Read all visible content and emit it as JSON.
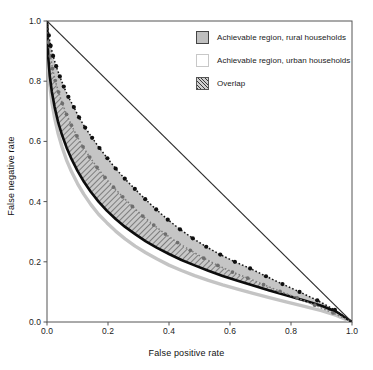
{
  "chart_data": {
    "type": "line",
    "title": "",
    "xlabel": "False positive rate",
    "ylabel": "False negative rate",
    "xlim": [
      0.0,
      1.0
    ],
    "ylim": [
      0.0,
      1.0
    ],
    "xticks": [
      "0.0",
      "0.2",
      "0.4",
      "0.6",
      "0.8",
      "1.0"
    ],
    "yticks": [
      "0.0",
      "0.2",
      "0.4",
      "0.6",
      "0.8",
      "1.0"
    ],
    "xtick_values": [
      0.0,
      0.2,
      0.4,
      0.6,
      0.8,
      1.0
    ],
    "ytick_values": [
      0.0,
      0.2,
      0.4,
      0.6,
      0.8,
      1.0
    ],
    "grid": false,
    "legend_position": "top-right",
    "legend": [
      "Achievable region, rural households",
      "Achievable region, urban households",
      "Overlap"
    ],
    "series": [
      {
        "name": "Reference diagonal",
        "style": "solid-thin",
        "color": "#333333",
        "x": [
          0.0,
          1.0
        ],
        "y": [
          1.0,
          0.0
        ]
      },
      {
        "name": "Rural upper boundary",
        "style": "dotted-markers",
        "color": "#111111",
        "x": [
          0.0,
          0.006,
          0.012,
          0.02,
          0.03,
          0.042,
          0.055,
          0.07,
          0.088,
          0.105,
          0.125,
          0.148,
          0.172,
          0.198,
          0.225,
          0.255,
          0.288,
          0.322,
          0.358,
          0.396,
          0.436,
          0.478,
          0.522,
          0.568,
          0.616,
          0.666,
          0.718,
          0.772,
          0.828,
          0.886,
          0.944,
          1.0
        ],
        "y": [
          1.0,
          0.952,
          0.918,
          0.884,
          0.85,
          0.816,
          0.782,
          0.748,
          0.714,
          0.68,
          0.646,
          0.612,
          0.578,
          0.544,
          0.51,
          0.476,
          0.442,
          0.408,
          0.374,
          0.34,
          0.308,
          0.278,
          0.25,
          0.224,
          0.2,
          0.178,
          0.152,
          0.126,
          0.1,
          0.072,
          0.04,
          0.0
        ]
      },
      {
        "name": "Rural lower boundary",
        "style": "dotted-markers",
        "color": "#7a7a7a",
        "x": [
          0.0,
          0.005,
          0.011,
          0.018,
          0.027,
          0.038,
          0.05,
          0.064,
          0.08,
          0.098,
          0.118,
          0.14,
          0.164,
          0.19,
          0.218,
          0.248,
          0.28,
          0.314,
          0.35,
          0.388,
          0.428,
          0.47,
          0.514,
          0.56,
          0.608,
          0.658,
          0.71,
          0.764,
          0.82,
          0.878,
          0.938,
          1.0
        ],
        "y": [
          1.0,
          0.93,
          0.884,
          0.842,
          0.802,
          0.764,
          0.726,
          0.69,
          0.654,
          0.618,
          0.582,
          0.548,
          0.514,
          0.48,
          0.448,
          0.416,
          0.384,
          0.352,
          0.322,
          0.292,
          0.264,
          0.238,
          0.212,
          0.188,
          0.166,
          0.146,
          0.124,
          0.102,
          0.08,
          0.056,
          0.03,
          0.0
        ]
      },
      {
        "name": "Urban upper boundary",
        "style": "solid-thick",
        "color": "#0d0d0d",
        "x": [
          0.0,
          0.004,
          0.009,
          0.016,
          0.025,
          0.036,
          0.049,
          0.064,
          0.081,
          0.1,
          0.121,
          0.144,
          0.169,
          0.196,
          0.225,
          0.256,
          0.289,
          0.324,
          0.361,
          0.4,
          0.441,
          0.484,
          0.529,
          0.576,
          0.625,
          0.676,
          0.729,
          0.784,
          0.841,
          0.9,
          0.949,
          1.0
        ],
        "y": [
          1.0,
          0.88,
          0.818,
          0.764,
          0.714,
          0.666,
          0.622,
          0.58,
          0.54,
          0.502,
          0.466,
          0.432,
          0.4,
          0.37,
          0.342,
          0.316,
          0.292,
          0.268,
          0.246,
          0.226,
          0.206,
          0.188,
          0.17,
          0.153,
          0.137,
          0.121,
          0.105,
          0.089,
          0.072,
          0.054,
          0.034,
          0.0
        ]
      },
      {
        "name": "Urban lower boundary",
        "style": "solid-light",
        "color": "#c4c4c4",
        "x": [
          0.0,
          0.004,
          0.009,
          0.016,
          0.025,
          0.036,
          0.049,
          0.064,
          0.081,
          0.1,
          0.121,
          0.144,
          0.169,
          0.196,
          0.225,
          0.256,
          0.289,
          0.324,
          0.361,
          0.4,
          0.441,
          0.484,
          0.529,
          0.576,
          0.625,
          0.676,
          0.729,
          0.784,
          0.841,
          0.9,
          0.949,
          1.0
        ],
        "y": [
          1.0,
          0.856,
          0.788,
          0.73,
          0.678,
          0.628,
          0.582,
          0.538,
          0.498,
          0.46,
          0.424,
          0.39,
          0.358,
          0.33,
          0.302,
          0.276,
          0.252,
          0.23,
          0.209,
          0.189,
          0.171,
          0.154,
          0.138,
          0.123,
          0.109,
          0.095,
          0.081,
          0.067,
          0.053,
          0.038,
          0.022,
          0.0
        ]
      }
    ],
    "annotations": []
  },
  "axes": {
    "xlabel": "False positive rate",
    "ylabel": "False negative rate",
    "xticks": [
      "0.0",
      "0.2",
      "0.4",
      "0.6",
      "0.8",
      "1.0"
    ],
    "yticks": [
      "0.0",
      "0.2",
      "0.4",
      "0.6",
      "0.8",
      "1.0"
    ]
  },
  "legend": {
    "items": [
      {
        "label": "Achievable region, rural households",
        "swatch": "gray-fill-dark-border"
      },
      {
        "label": "Achievable region, urban households",
        "swatch": "white-fill-light-border"
      },
      {
        "label": "Overlap",
        "swatch": "diagonal-hatch"
      }
    ]
  },
  "colors": {
    "rural_fill": "#bfbfbf",
    "rural_border": "#444444",
    "urban_fill": "#ffffff",
    "urban_border": "#c8c8c8",
    "overlap_hatch": "#3a3a3a",
    "diagonal": "#333333",
    "axis": "#555555",
    "text": "#1a1a1a"
  }
}
